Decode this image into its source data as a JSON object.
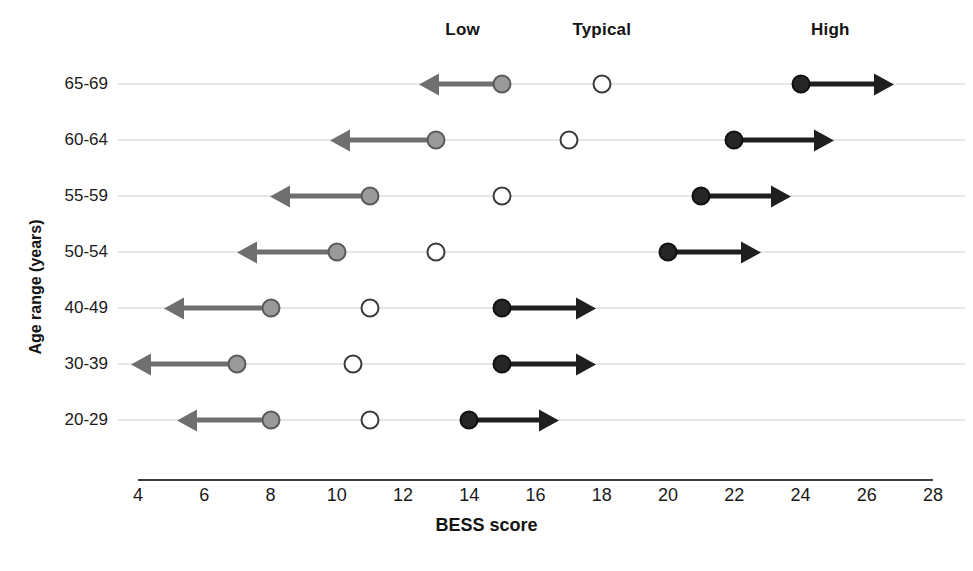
{
  "legend": [
    {
      "label": "Low",
      "x_score": 13.8,
      "key": "low"
    },
    {
      "label": "Typical",
      "x_score": 18.0,
      "key": "typical"
    },
    {
      "label": "High",
      "x_score": 24.9,
      "key": "high"
    }
  ],
  "axis": {
    "x_title": "BESS score",
    "y_title": "Age range (years)",
    "x_ticks": [
      4,
      6,
      8,
      10,
      12,
      14,
      16,
      18,
      20,
      22,
      24,
      26,
      28
    ],
    "xlim": [
      4,
      28
    ]
  },
  "colors": {
    "low_fill": "#9a9a9a",
    "low_stroke": "#5a5a5a",
    "typical_fill": "#ffffff",
    "typical_stroke": "#3a3a3a",
    "high_fill": "#262626",
    "high_stroke": "#111111",
    "low_arrow": "#6f6f6f",
    "high_arrow": "#1f1f1f",
    "row_line": "#cfcfcf",
    "axis_line": "#3d3d3d"
  },
  "chart_data": {
    "type": "scatter",
    "title": "",
    "xlabel": "BESS score",
    "ylabel": "Age range (years)",
    "xlim": [
      4,
      28
    ],
    "xticks": [
      4,
      6,
      8,
      10,
      12,
      14,
      16,
      18,
      20,
      22,
      24,
      26,
      28
    ],
    "grid": false,
    "legend_position": "top",
    "legend": [
      "Low",
      "Typical",
      "High"
    ],
    "categories": [
      "65-69",
      "60-64",
      "55-59",
      "50-54",
      "40-49",
      "30-39",
      "20-29"
    ],
    "series": [
      {
        "name": "Low",
        "values": [
          15,
          13,
          11,
          10,
          8,
          7,
          8
        ]
      },
      {
        "name": "Typical",
        "values": [
          18,
          17,
          15,
          13,
          11,
          10.5,
          11
        ]
      },
      {
        "name": "High",
        "values": [
          24,
          22,
          21,
          20,
          15,
          15,
          14
        ]
      }
    ],
    "arrows": [
      {
        "category": "65-69",
        "low_arrow_to": 13.0,
        "high_arrow_to": 26.3
      },
      {
        "category": "60-64",
        "low_arrow_to": 10.3,
        "high_arrow_to": 24.5
      },
      {
        "category": "55-59",
        "low_arrow_to": 8.5,
        "high_arrow_to": 23.2
      },
      {
        "category": "50-54",
        "low_arrow_to": 7.5,
        "high_arrow_to": 22.3
      },
      {
        "category": "40-49",
        "low_arrow_to": 5.3,
        "high_arrow_to": 17.3
      },
      {
        "category": "30-39",
        "low_arrow_to": 4.3,
        "high_arrow_to": 17.3
      },
      {
        "category": "20-29",
        "low_arrow_to": 5.7,
        "high_arrow_to": 16.2
      }
    ]
  },
  "rows": [
    {
      "label": "65-69",
      "low": 15,
      "typical": 18,
      "high": 24,
      "low_arrow_to": 13.0,
      "high_arrow_to": 26.3
    },
    {
      "label": "60-64",
      "low": 13,
      "typical": 17,
      "high": 22,
      "low_arrow_to": 10.3,
      "high_arrow_to": 24.5
    },
    {
      "label": "55-59",
      "low": 11,
      "typical": 15,
      "high": 21,
      "low_arrow_to": 8.5,
      "high_arrow_to": 23.2
    },
    {
      "label": "50-54",
      "low": 10,
      "typical": 13,
      "high": 20,
      "low_arrow_to": 7.5,
      "high_arrow_to": 22.3
    },
    {
      "label": "40-49",
      "low": 8,
      "typical": 11,
      "high": 15,
      "low_arrow_to": 5.3,
      "high_arrow_to": 17.3
    },
    {
      "label": "30-39",
      "low": 7,
      "typical": 10.5,
      "high": 15,
      "low_arrow_to": 4.3,
      "high_arrow_to": 17.3
    },
    {
      "label": "20-29",
      "low": 8,
      "typical": 11,
      "high": 14,
      "low_arrow_to": 5.7,
      "high_arrow_to": 16.2
    }
  ]
}
